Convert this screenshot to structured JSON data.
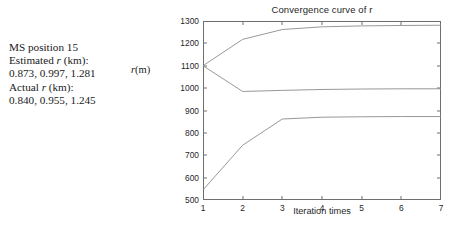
{
  "annotation": {
    "lines": [
      "MS position 15",
      "Estimated r (km):",
      "0.873, 0.997, 1.281",
      "Actual r (km):",
      "0.840, 0.955, 1.245"
    ],
    "line1": "MS position 15",
    "line2_prefix": "Estimated ",
    "line2_italic": "r",
    "line2_suffix": " (km):",
    "line3": "0.873, 0.997, 1.281",
    "line4_prefix": "Actual ",
    "line4_italic": "r",
    "line4_suffix": " (km):",
    "line5": "0.840, 0.955, 1.245"
  },
  "chart_data": {
    "type": "line",
    "title": "Convergence curve of r",
    "xlabel": "Iteration times",
    "ylabel": "r(m)",
    "ylabel_italic": "r",
    "ylabel_rest": "(m)",
    "x": [
      1,
      2,
      3,
      4,
      5,
      6,
      7
    ],
    "xlim": [
      1,
      7
    ],
    "ylim": [
      500,
      1300
    ],
    "xticks": [
      "1",
      "2",
      "3",
      "4",
      "5",
      "6",
      "7"
    ],
    "yticks": [
      "1300",
      "1200",
      "1100",
      "1000",
      "900",
      "800",
      "700",
      "600",
      "500"
    ],
    "ytick_values": [
      1300,
      1200,
      1100,
      1000,
      900,
      800,
      700,
      600,
      500
    ],
    "grid": false,
    "legend": "none",
    "line_color": "#8c8c8c",
    "axis_color": "#6e6e6e",
    "series": [
      {
        "name": "r1",
        "values": [
          545,
          745,
          862,
          870,
          872,
          873,
          873
        ]
      },
      {
        "name": "r2",
        "values": [
          1100,
          985,
          990,
          994,
          996,
          997,
          997
        ]
      },
      {
        "name": "r3",
        "values": [
          1100,
          1218,
          1262,
          1274,
          1278,
          1280,
          1281
        ]
      }
    ]
  },
  "bottom_noise": {
    "text": ""
  }
}
